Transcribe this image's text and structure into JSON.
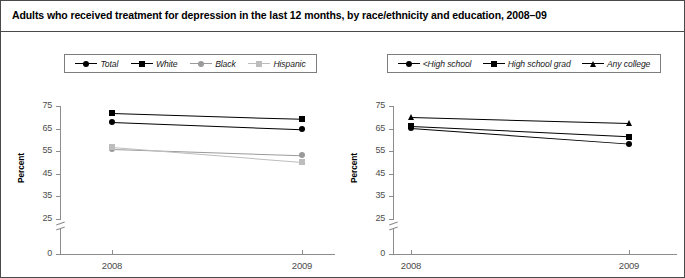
{
  "title": "Adults who received treatment for depression in the last 12 months, by race/ethnicity and education, 2008–09",
  "charts": [
    {
      "panel": "left",
      "ylabel": "Percent",
      "legend": [
        {
          "label": "Total",
          "marker": "circle",
          "color": "#000000"
        },
        {
          "label": "White",
          "marker": "square",
          "color": "#000000"
        },
        {
          "label": "Black",
          "marker": "circle",
          "color": "#9a9a9a"
        },
        {
          "label": "Hispanic",
          "marker": "square",
          "color": "#bdbdbd"
        }
      ],
      "chart_data": {
        "type": "line",
        "title": "Adults who received treatment for depression in the last 12 months, by race/ethnicity",
        "xlabel": "",
        "ylabel": "Percent",
        "x": [
          "2008",
          "2009"
        ],
        "categories": [
          "2008",
          "2009"
        ],
        "yticks": [
          0,
          25,
          35,
          45,
          55,
          65,
          75
        ],
        "ylim": [
          25,
          75
        ],
        "axis_break": true,
        "grid": false,
        "legend_position": "top",
        "series": [
          {
            "name": "Total",
            "values": [
              68.0,
              64.8
            ],
            "marker": "circle",
            "color": "#000000"
          },
          {
            "name": "White",
            "values": [
              71.8,
              69.2
            ],
            "marker": "square",
            "color": "#000000"
          },
          {
            "name": "Black",
            "values": [
              56.1,
              53.3
            ],
            "marker": "circle",
            "color": "#9a9a9a"
          },
          {
            "name": "Hispanic",
            "values": [
              56.8,
              50.2
            ],
            "marker": "square",
            "color": "#bdbdbd"
          }
        ]
      }
    },
    {
      "panel": "right",
      "ylabel": "Percent",
      "legend": [
        {
          "label": "<High school",
          "marker": "circle",
          "color": "#000000"
        },
        {
          "label": "High school grad",
          "marker": "square",
          "color": "#000000"
        },
        {
          "label": "Any college",
          "marker": "triangle",
          "color": "#000000"
        }
      ],
      "chart_data": {
        "type": "line",
        "title": "Adults who received treatment for depression in the last 12 months, by education",
        "xlabel": "",
        "ylabel": "Percent",
        "x": [
          "2008",
          "2009"
        ],
        "categories": [
          "2008",
          "2009"
        ],
        "yticks": [
          0,
          25,
          35,
          45,
          55,
          65,
          75
        ],
        "ylim": [
          25,
          75
        ],
        "axis_break": true,
        "grid": false,
        "legend_position": "top",
        "series": [
          {
            "name": "<High school",
            "values": [
              65.2,
              58.3
            ],
            "marker": "circle",
            "color": "#000000"
          },
          {
            "name": "High school grad",
            "values": [
              66.0,
              61.5
            ],
            "marker": "square",
            "color": "#000000"
          },
          {
            "name": "Any college",
            "values": [
              70.3,
              67.6
            ],
            "marker": "triangle",
            "color": "#000000"
          }
        ]
      }
    }
  ]
}
